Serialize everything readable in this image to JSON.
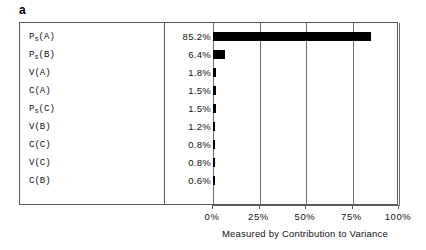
{
  "panel": {
    "letter": "a"
  },
  "table": {
    "label_column_header": "",
    "value_column_header": ""
  },
  "axis_caption": "Measured by Contribution to Variance",
  "chart_data": {
    "type": "bar",
    "orientation": "horizontal",
    "title": "",
    "subtitle": "",
    "xlabel": "Measured by Contribution to Variance",
    "ylabel": "",
    "xlim": [
      0,
      100
    ],
    "grid": true,
    "legend": null,
    "tick_labels": [
      "0%",
      "25%",
      "50%",
      "75%",
      "100%"
    ],
    "tick_values": [
      0,
      25,
      50,
      75,
      100
    ],
    "categories": [
      "Ps(A)",
      "Ps(B)",
      "V(A)",
      "C(A)",
      "Ps(C)",
      "V(B)",
      "C(C)",
      "V(C)",
      "C(B)"
    ],
    "category_parts": [
      {
        "base": "P",
        "sub": "s",
        "suffix": "(A)"
      },
      {
        "base": "P",
        "sub": "s",
        "suffix": "(B)"
      },
      {
        "base": "V",
        "sub": "",
        "suffix": "(A)"
      },
      {
        "base": "C",
        "sub": "",
        "suffix": "(A)"
      },
      {
        "base": "P",
        "sub": "s",
        "suffix": "(C)"
      },
      {
        "base": "V",
        "sub": "",
        "suffix": "(B)"
      },
      {
        "base": "C",
        "sub": "",
        "suffix": "(C)"
      },
      {
        "base": "V",
        "sub": "",
        "suffix": "(C)"
      },
      {
        "base": "C",
        "sub": "",
        "suffix": "(B)"
      }
    ],
    "values": [
      85.2,
      6.4,
      1.8,
      1.5,
      1.5,
      1.2,
      0.8,
      0.8,
      0.6
    ],
    "value_labels": [
      "85.2%",
      "6.4%",
      "1.8%",
      "1.5%",
      "1.5%",
      "1.2%",
      "0.8%",
      "0.8%",
      "0.6%"
    ],
    "bar_color": "#000000",
    "frame_color": "#5a5a5a"
  }
}
